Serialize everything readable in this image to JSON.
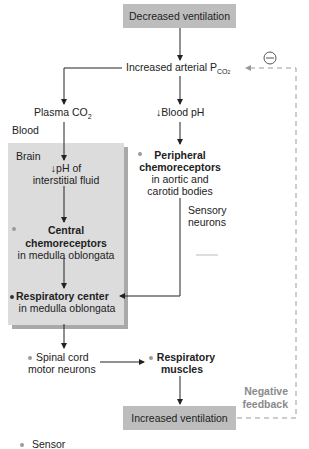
{
  "diagram": {
    "top_box": "Decreased ventilation",
    "arterial_pco2": {
      "prefix": "Increased arterial P",
      "sub": "CO",
      "sub2": "2"
    },
    "plasma_co2": {
      "text": "Plasma CO",
      "sub": "2"
    },
    "blood_ph": "↓Blood pH",
    "blood_label": "Blood",
    "brain_label": "Brain",
    "interstitial_ph": [
      "↓pH of",
      "interstitial fluid"
    ],
    "central_chemo": {
      "title1": "Central",
      "title2": "chemoreceptors",
      "sub": "in medulla oblongata"
    },
    "peripheral_chemo": {
      "title1": "Peripheral",
      "title2": "chemoreceptors",
      "sub1": "in aortic and",
      "sub2": "carotid bodies"
    },
    "sensory_neurons": [
      "Sensory",
      "neurons"
    ],
    "resp_center": {
      "title": "Respiratory center",
      "sub": "in medulla oblongata"
    },
    "spinal_cord": [
      "Spinal cord",
      "motor neurons"
    ],
    "resp_muscles": [
      "Respiratory",
      "muscles"
    ],
    "bottom_box": "Increased ventilation",
    "negative_feedback": [
      "Negative",
      "feedback"
    ],
    "minus_symbol": "−",
    "legend": {
      "sensor": "Sensor"
    }
  },
  "colors": {
    "box": "#bdbdbd",
    "brain": "#dcdcdc",
    "sensor_dot": "#9a9a9a",
    "feedback": "#9a9a9a"
  }
}
